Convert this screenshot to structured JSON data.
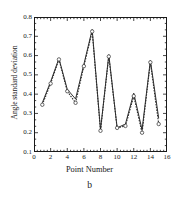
{
  "chart_data": {
    "type": "line",
    "title": "",
    "panel_label": "b",
    "xlabel": "Point Number",
    "ylabel": "Angle standard deviation",
    "xlim": [
      0,
      16
    ],
    "ylim": [
      0.1,
      0.8
    ],
    "xticks": [
      0,
      2,
      4,
      6,
      8,
      10,
      12,
      14,
      16
    ],
    "xtick_labels": [
      "0",
      "2",
      "4",
      "6",
      "8",
      "10",
      "12",
      "14",
      "16"
    ],
    "yticks": [
      0.1,
      0.2,
      0.3,
      0.4,
      0.5,
      0.6,
      0.7,
      0.8
    ],
    "ytick_labels": [
      "0.1",
      "0.2",
      "0.3",
      "0.4",
      "0.5",
      "0.6",
      "0.7",
      "0.8"
    ],
    "x_minor_ticks_per_interval": 4,
    "y_minor_ticks_per_interval": 2,
    "grid": false,
    "legend": "none",
    "x": [
      1,
      2,
      3,
      4,
      5,
      6,
      7,
      8,
      9,
      10,
      11,
      12,
      13,
      14,
      15
    ],
    "series": [
      {
        "name": "solid",
        "style": "solid",
        "marker": "none",
        "color": "#1a1a1a",
        "values": [
          0.355,
          0.465,
          0.585,
          0.425,
          0.375,
          0.555,
          0.735,
          0.215,
          0.605,
          0.225,
          0.245,
          0.405,
          0.215,
          0.575,
          0.275
        ]
      },
      {
        "name": "dashed-open-circles",
        "style": "dashed",
        "marker": "open-circle",
        "color": "#2b2b2b",
        "values": [
          0.345,
          0.455,
          0.58,
          0.415,
          0.355,
          0.545,
          0.725,
          0.21,
          0.595,
          0.225,
          0.235,
          0.39,
          0.2,
          0.565,
          0.245
        ]
      }
    ]
  },
  "axes": {
    "frame_color": "#1a1a1a"
  }
}
